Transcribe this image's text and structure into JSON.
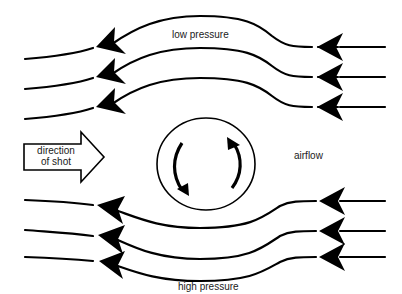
{
  "diagram": {
    "type": "flow-diagram",
    "colors": {
      "stroke": "#000000",
      "background": "#ffffff",
      "text": "#1a1a1a"
    },
    "labels": {
      "top": "low pressure",
      "bottom": "high pressure",
      "right": "airflow",
      "shot_line1": "direction",
      "shot_line2": "of shot"
    },
    "ball": {
      "rotation": "clockwise-in-view (top moves right, bottom moves left)",
      "rotation_arrows": 2
    },
    "streamlines": {
      "top_group": {
        "count": 3,
        "direction": "right-to-left",
        "deflection": "upward over ball"
      },
      "bottom_group": {
        "count": 3,
        "direction": "right-to-left",
        "deflection": "downward under ball"
      }
    },
    "shot_arrow": {
      "direction": "right",
      "style": "hollow block arrow"
    }
  }
}
